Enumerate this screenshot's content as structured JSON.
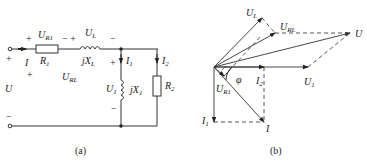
{
  "circuit": {
    "caption": "(a)",
    "source_voltage": "U",
    "source_plus": "+",
    "source_minus": "−",
    "current_total": "I",
    "resistor1": {
      "label": "R",
      "sub": "1"
    },
    "voltage_R1": {
      "label": "U",
      "sub": "R1"
    },
    "inductor_L": {
      "label": "jX",
      "sub": "L"
    },
    "voltage_L": {
      "label": "U",
      "sub": "L"
    },
    "voltage_RL": {
      "label": "U",
      "sub": "RL"
    },
    "current_1": {
      "label": "I",
      "sub": "1"
    },
    "inductor_1": {
      "label": "jX",
      "sub": "1"
    },
    "voltage_1": {
      "label": "U",
      "sub": "1"
    },
    "current_2": {
      "label": "I",
      "sub": "2"
    },
    "resistor2": {
      "label": "R",
      "sub": "2"
    },
    "plus": "+",
    "minus": "−"
  },
  "phasor": {
    "caption": "(b)",
    "vectors": [
      {
        "label": "U",
        "sub": "L"
      },
      {
        "label": "U",
        "sub": "RL"
      },
      {
        "label": "U",
        "sub": ""
      },
      {
        "label": "U",
        "sub": "1"
      },
      {
        "label": "U",
        "sub": "R1"
      },
      {
        "label": "I",
        "sub": "1"
      },
      {
        "label": "I",
        "sub": "2"
      },
      {
        "label": "I",
        "sub": ""
      }
    ],
    "angle": "φ"
  }
}
